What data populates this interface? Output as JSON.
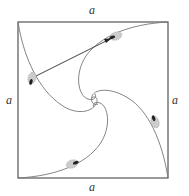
{
  "diagram": {
    "side_labels": {
      "top": "a",
      "bottom": "a",
      "left": "a",
      "right": "a"
    },
    "square": {
      "x": 18,
      "y": 22,
      "width": 150,
      "height": 156
    },
    "center": {
      "x": 95,
      "y": 102
    },
    "bugs": [
      {
        "id": "bug-top",
        "x": 116,
        "y": 36
      },
      {
        "id": "bug-left",
        "x": 32,
        "y": 78
      },
      {
        "id": "bug-bottom",
        "x": 72,
        "y": 164
      },
      {
        "id": "bug-right",
        "x": 155,
        "y": 122
      }
    ],
    "connector": {
      "from": "bug-left",
      "to": "bug-top"
    },
    "colors": {
      "square_stroke": "#555555",
      "curve_stroke": "#777777",
      "bug_fill": "#bbbbbb",
      "bug_head": "#222222"
    }
  }
}
